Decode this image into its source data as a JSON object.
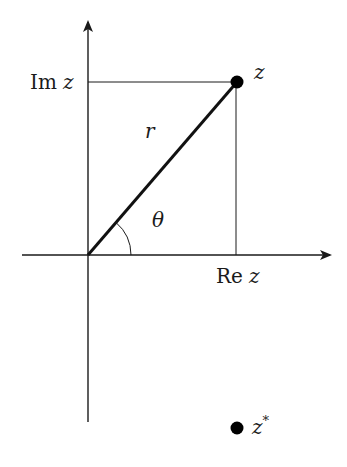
{
  "diagram": {
    "type": "complex-plane-polar-form",
    "labels": {
      "im_axis": "Im",
      "im_var": "z",
      "re_axis": "Re",
      "re_var": "z",
      "point": "z",
      "modulus": "r",
      "angle": "θ",
      "conjugate_base": "z",
      "conjugate_sup": "*"
    },
    "geometry": {
      "origin": [
        88,
        255
      ],
      "point_z": [
        237,
        82
      ],
      "point_z_conjugate": [
        237,
        428
      ],
      "x_axis": {
        "from": 22,
        "to": 332
      },
      "y_axis": {
        "from": 422,
        "to": 20
      },
      "angle_arc_radius": 43
    },
    "colors": {
      "line": "#1a1a1a",
      "point": "#000000",
      "background": "#ffffff"
    }
  }
}
